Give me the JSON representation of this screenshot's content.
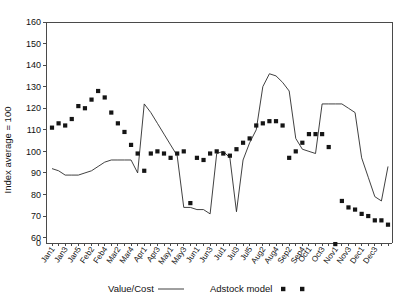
{
  "chart_data": {
    "type": "line",
    "title": "",
    "xlabel": "",
    "ylabel": "Index average = 100",
    "ylim": [
      55,
      160
    ],
    "yticks": [
      60,
      70,
      80,
      90,
      100,
      110,
      120,
      130,
      140,
      150,
      160
    ],
    "y_axis_break": true,
    "y_break_label": "0",
    "grid": false,
    "legend_position": "bottom",
    "x": [
      "Jan1",
      "Jan2",
      "Jan3",
      "Jan4",
      "Jan5",
      "Feb1",
      "Feb2",
      "Feb3",
      "Feb4",
      "Mar1",
      "Mar2",
      "Mar3",
      "Mar4",
      "Mar5",
      "Apr1",
      "Apr2",
      "Apr3",
      "Apr4",
      "May1",
      "May2",
      "May3",
      "May4",
      "Jun1",
      "Jun2",
      "Jun3",
      "Jun4",
      "Jul1",
      "Jul2",
      "Jul3",
      "Jul4",
      "Jul5",
      "Aug1",
      "Aug2",
      "Aug3",
      "Aug4",
      "Sep1",
      "Sep2",
      "Sep3",
      "Sep4",
      "Oct1",
      "Oct2",
      "Oct3",
      "Oct4",
      "Nov1",
      "Nov2",
      "Nov3",
      "Nov4",
      "Dec1",
      "Dec2",
      "Dec3",
      "Dec4",
      "Dec5"
    ],
    "xtick_labels_shown": [
      "Jan1",
      "Jan3",
      "Jan5",
      "Feb2",
      "Feb4",
      "Mar2",
      "Mar4",
      "Apr1",
      "Apr3",
      "May1",
      "May3",
      "Jun1",
      "Jun3",
      "Jul1",
      "Jul3",
      "Jul5",
      "Aug2",
      "Aug4",
      "Sep2",
      "Sep4",
      "Oct1",
      "Oct3",
      "Nov1",
      "Nov3",
      "Dec1",
      "Dec3"
    ],
    "series": [
      {
        "name": "Value/Cost",
        "render": "line",
        "values": [
          92,
          91,
          89,
          89,
          89,
          90,
          91,
          93,
          95,
          96,
          96,
          96,
          96,
          90,
          122,
          118,
          113,
          108,
          103,
          98,
          74,
          74,
          73,
          73,
          71,
          99,
          100,
          97,
          72,
          96,
          104,
          110,
          130,
          136,
          135,
          132,
          128,
          106,
          101,
          100,
          99,
          122,
          122,
          122,
          122,
          120,
          118,
          97,
          88,
          79,
          77,
          93
        ]
      },
      {
        "name": "Adstock model",
        "render": "markers",
        "values": [
          111,
          113,
          112,
          115,
          121,
          120,
          124,
          128,
          125,
          118,
          113,
          109,
          103,
          99,
          91,
          99,
          100,
          99,
          97,
          99,
          100,
          76,
          97,
          96,
          99,
          100,
          99,
          98,
          101,
          104,
          106,
          112,
          113,
          114,
          114,
          112,
          97,
          100,
          104,
          108,
          108,
          108,
          102,
          57,
          77,
          74,
          73,
          71,
          70,
          68,
          68,
          66
        ]
      }
    ],
    "legend": [
      {
        "label": "Value/Cost",
        "marker": "line"
      },
      {
        "label": "Adstock model",
        "marker": "square"
      }
    ]
  },
  "colors": {
    "line": "#2b2b2b",
    "marker": "#151515",
    "axis": "#4a4a4a",
    "text": "#111111",
    "background": "#ffffff"
  }
}
